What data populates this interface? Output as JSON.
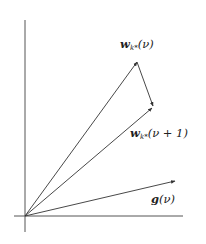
{
  "diagram": {
    "type": "vector-diagram",
    "colors": {
      "axis": "#555555",
      "vector": "#333333",
      "text": "#222222",
      "background": "#ffffff"
    },
    "origin": [
      25,
      216
    ],
    "axes": {
      "vertical": {
        "x": 25,
        "y1": 20,
        "y2": 232
      },
      "horizontal": {
        "y": 216,
        "x1": 14,
        "x2": 183
      }
    },
    "vectors": [
      {
        "id": "w_nu",
        "from": [
          25,
          216
        ],
        "to": [
          137,
          62
        ]
      },
      {
        "id": "w_nu_plus_1",
        "from": [
          25,
          216
        ],
        "to": [
          152,
          108
        ]
      },
      {
        "id": "delta",
        "from": [
          137,
          62
        ],
        "to": [
          153,
          106
        ]
      },
      {
        "id": "g_nu",
        "from": [
          25,
          216
        ],
        "to": [
          175,
          181
        ]
      }
    ],
    "labels": {
      "w_nu": {
        "symbol": "w",
        "subscript": "k*",
        "argument": "(ν)"
      },
      "w_nu_plus_1": {
        "symbol": "w",
        "subscript": "k*",
        "argument": "(ν + 1)"
      },
      "g_nu": {
        "symbol": "g",
        "argument": "(ν)"
      }
    }
  }
}
